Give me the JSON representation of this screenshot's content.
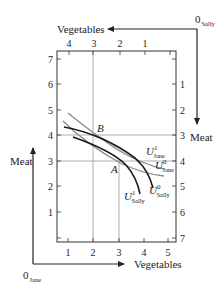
{
  "diagram": {
    "type": "edgeworth-box",
    "origins": {
      "jane": {
        "label": "0",
        "sub": "Jane"
      },
      "sally": {
        "label": "0",
        "sub": "Sally"
      }
    },
    "axes": {
      "jane_x_label": "Vegetables",
      "jane_y_label": "Meat",
      "sally_x_label": "Vegetables",
      "sally_y_label": "Meat",
      "bottom_ticks": [
        "1",
        "2",
        "3",
        "4",
        "5"
      ],
      "top_ticks": [
        "4",
        "3",
        "2",
        "1"
      ],
      "left_ticks": [
        "7",
        "6",
        "5",
        "4",
        "3",
        "2",
        "1"
      ],
      "right_ticks": [
        "1",
        "2",
        "3",
        "4",
        "5",
        "6",
        "7"
      ]
    },
    "points": {
      "A": {
        "label": "A",
        "jane_veg": 3,
        "jane_meat": 3
      },
      "B": {
        "label": "B",
        "jane_veg": 2,
        "jane_meat": 4
      }
    },
    "curves": [
      {
        "id": "U1_jane",
        "label": "U",
        "sup": "1",
        "sub": "Jane",
        "color": "#8a8a8a"
      },
      {
        "id": "U0_jane",
        "label": "U",
        "sup": "0",
        "sub": "Jane",
        "color": "#8a8a8a"
      },
      {
        "id": "U0_sally",
        "label": "U",
        "sup": "0",
        "sub": "Sally",
        "color": "#1a1a1a"
      },
      {
        "id": "U1_sally",
        "label": "U",
        "sup": "1",
        "sub": "Sally",
        "color": "#1a1a1a"
      }
    ],
    "lens_fill": "#d4d4d4"
  }
}
